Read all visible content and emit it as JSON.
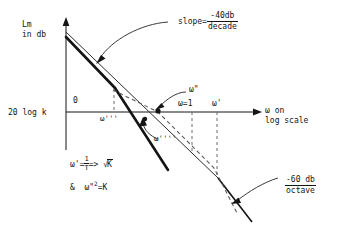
{
  "figure": {
    "type": "diagram",
    "axes": {
      "y_label_line1": "Lm",
      "y_label_line2": "in db",
      "y_origin_mark": "0",
      "y_gain_label": "20 log k",
      "x_label_line1": "ω on",
      "x_label_line2": "log scale"
    },
    "annotations": {
      "slope_top_prefix": "slope=",
      "slope_top_num": "-40db",
      "slope_top_den": "decade",
      "slope_bottom_num": "-60 db",
      "slope_bottom_den": "octave",
      "omega_tripleprime": "ω'''",
      "omega_doubleprime": "ω\"",
      "omega_quadprime": "ω''''",
      "omega_unity": "ω=1",
      "omega_prime": "ω'"
    },
    "equations": {
      "line1_lhs": "ω'=",
      "line1_num": "1",
      "line1_den": "T",
      "line1_rel": "=>",
      "line1_rhs": "K",
      "line2_amp": "&",
      "line2_lhs": "ω\"",
      "line2_exp": "2",
      "line2_rhs": "=K"
    },
    "colors": {
      "ink": "#141414",
      "thin": "#4a4a4a",
      "dashed": "#6b6b6b"
    }
  }
}
